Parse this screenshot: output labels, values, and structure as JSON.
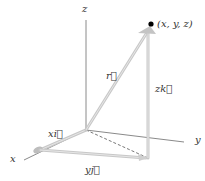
{
  "diagram": {
    "axes": {
      "x_label": "x",
      "y_label": "y",
      "z_label": "z"
    },
    "point": {
      "label": "(x, y, z)"
    },
    "vectors": {
      "r_label": "r⃗",
      "xi_label": "xi⃗",
      "yj_label": "yj⃗",
      "zk_label": "zk⃗"
    },
    "colors": {
      "axis": "#8a8a8a",
      "vector": "#c8c8c8",
      "point": "#000000",
      "text": "#333333"
    }
  }
}
